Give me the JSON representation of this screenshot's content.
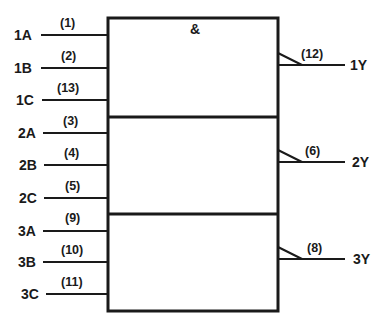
{
  "diagram": {
    "type": "logic-symbol",
    "function_symbol": "&",
    "colors": {
      "line": "#1a1a1a",
      "background": "#ffffff"
    },
    "gates": [
      {
        "inputs": [
          {
            "signal": "1A",
            "pin": "(1)"
          },
          {
            "signal": "1B",
            "pin": "(2)"
          },
          {
            "signal": "1C",
            "pin": "(13)"
          }
        ],
        "output": {
          "signal": "1Y",
          "pin": "(12)"
        }
      },
      {
        "inputs": [
          {
            "signal": "2A",
            "pin": "(3)"
          },
          {
            "signal": "2B",
            "pin": "(4)"
          },
          {
            "signal": "2C",
            "pin": "(5)"
          }
        ],
        "output": {
          "signal": "2Y",
          "pin": "(6)"
        }
      },
      {
        "inputs": [
          {
            "signal": "3A",
            "pin": "(9)"
          },
          {
            "signal": "3B",
            "pin": "(10)"
          },
          {
            "signal": "3C",
            "pin": "(11)"
          }
        ],
        "output": {
          "signal": "3Y",
          "pin": "(8)"
        }
      }
    ]
  }
}
